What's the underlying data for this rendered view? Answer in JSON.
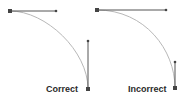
{
  "diagrams": [
    {
      "id": "correct",
      "label": "Correct",
      "handle_lengths": "balanced"
    },
    {
      "id": "incorrect",
      "label": "Incorrect",
      "handle_lengths": "unbalanced"
    }
  ],
  "colors": {
    "handle": "#555555",
    "curve": "#b8b8b8",
    "anchor": "#444444",
    "text": "#2a2a2a",
    "background": "#ffffff"
  }
}
